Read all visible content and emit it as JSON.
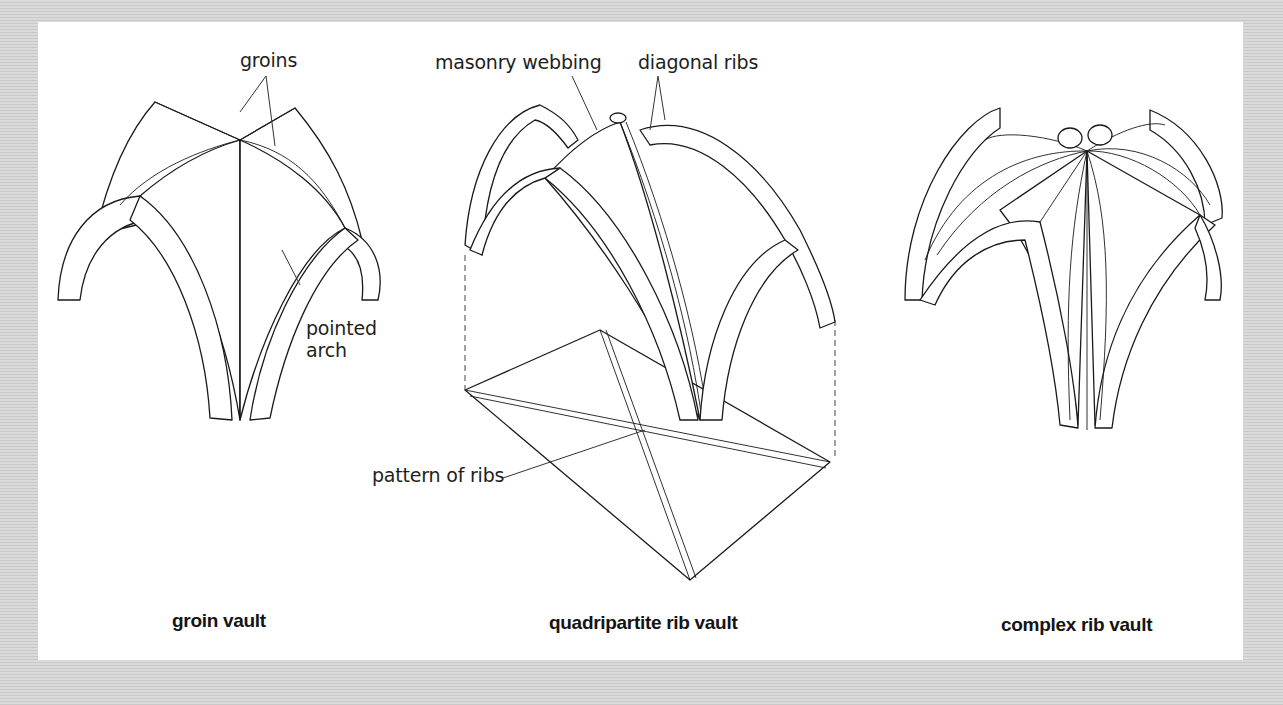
{
  "figure": {
    "background_color": "#d4d4d4",
    "panel_color": "#ffffff",
    "line_color": "#1a1a1a"
  },
  "vaults": [
    {
      "caption": "groin vault",
      "annotations": [
        {
          "text": "groins"
        },
        {
          "text": "pointed\narch"
        }
      ]
    },
    {
      "caption": "quadripartite rib vault",
      "annotations": [
        {
          "text": "masonry webbing"
        },
        {
          "text": "diagonal ribs"
        },
        {
          "text": "pattern of ribs"
        }
      ]
    },
    {
      "caption": "complex rib vault",
      "annotations": []
    }
  ]
}
